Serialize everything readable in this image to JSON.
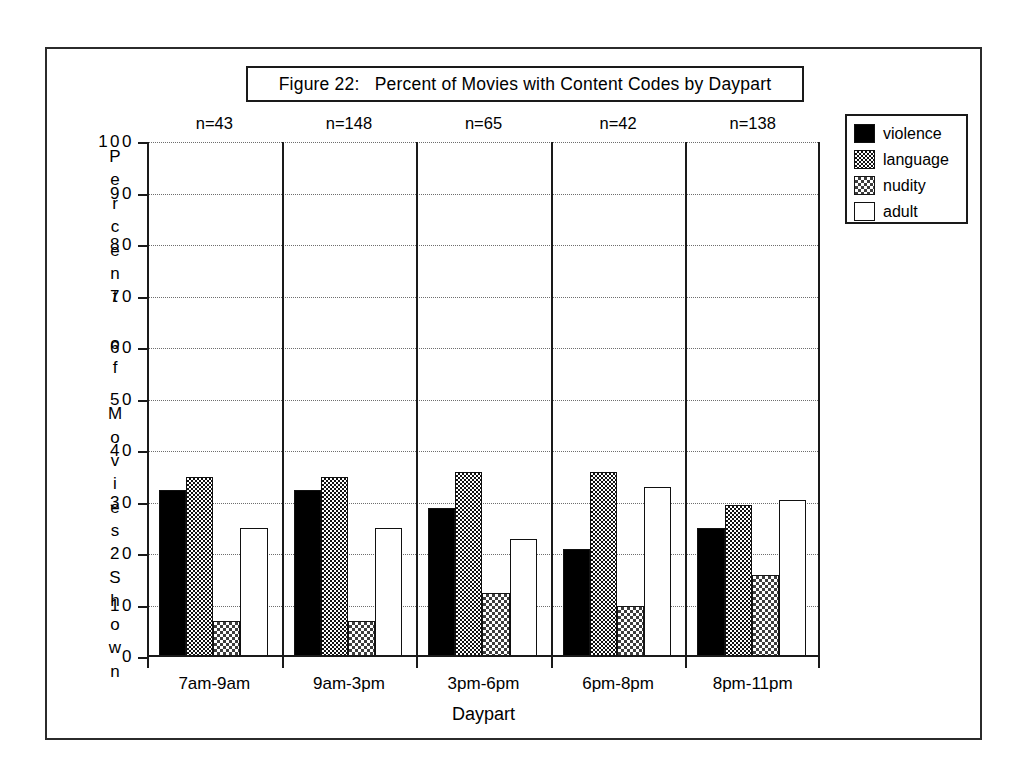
{
  "figure": {
    "title": "Figure 22:   Percent of Movies with Content Codes by Daypart"
  },
  "chart_data": {
    "type": "bar",
    "title": "Figure 22:   Percent of Movies with Content Codes by Daypart",
    "xlabel": "Daypart",
    "ylabel": "Percent of Movies Shown",
    "ylim": [
      0,
      100
    ],
    "ytick_values": [
      0,
      10,
      20,
      30,
      40,
      50,
      60,
      70,
      80,
      90,
      100
    ],
    "ytick_labels": [
      "0",
      "10",
      "20",
      "30",
      "40",
      "50",
      "60",
      "70",
      "80",
      "90",
      "100"
    ],
    "grid": true,
    "grid_style": "dotted-horizontal",
    "legend_position": "top-right-outside",
    "categories": [
      "7am-9am",
      "9am-3pm",
      "3pm-6pm",
      "6pm-8pm",
      "8pm-11pm"
    ],
    "group_annotations": [
      "n=43",
      "n=148",
      "n=65",
      "n=42",
      "n=138"
    ],
    "series": [
      {
        "name": "violence",
        "fill": "solid-black",
        "values": [
          32.5,
          32.5,
          29.0,
          21.0,
          25.0
        ]
      },
      {
        "name": "language",
        "fill": "dark-checker",
        "values": [
          35.0,
          35.0,
          36.0,
          36.0,
          29.5
        ]
      },
      {
        "name": "nudity",
        "fill": "mid-dither",
        "values": [
          7.0,
          7.0,
          12.5,
          10.0,
          16.0
        ]
      },
      {
        "name": "adult",
        "fill": "light-dither",
        "values": [
          25.0,
          25.0,
          23.0,
          33.0,
          30.5
        ]
      }
    ]
  },
  "yaxis_title_letters": [
    "P",
    "e",
    "r",
    "c",
    "e",
    "n",
    "t",
    "",
    "o",
    "f",
    "",
    "M",
    "o",
    "v",
    "i",
    "e",
    "s",
    "",
    "S",
    "h",
    "o",
    "w",
    "n"
  ],
  "legend": {
    "items": [
      {
        "label": "violence"
      },
      {
        "label": "language"
      },
      {
        "label": "nudity"
      },
      {
        "label": "adult"
      }
    ]
  },
  "colors": {
    "ink": "#1a1a1a",
    "frame": "#2b2b2b",
    "background": "#ffffff"
  }
}
